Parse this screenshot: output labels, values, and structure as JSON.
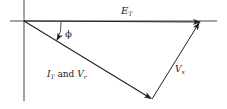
{
  "diagram": {
    "type": "phasor-diagram",
    "colors": {
      "line": "#222222",
      "background": "#ffffff"
    },
    "labels": {
      "et": {
        "main": "E",
        "sub": "T"
      },
      "phi": "ϕ",
      "it_vr": {
        "i_main": "I",
        "i_sub": "T",
        "and": " and ",
        "v_main": "V",
        "v_sub": "r"
      },
      "vx": {
        "main": "V",
        "sub": "x"
      }
    },
    "vectors": [
      {
        "name": "E_T",
        "from": [
          24,
          21
        ],
        "to": [
          200,
          22
        ]
      },
      {
        "name": "I_T and V_r",
        "from": [
          24,
          21
        ],
        "to": [
          152,
          99
        ]
      },
      {
        "name": "V_x",
        "from": [
          152,
          99
        ],
        "to": [
          200,
          22
        ]
      }
    ],
    "axes": {
      "horizontal": {
        "from": [
          10,
          21
        ],
        "to": [
          217,
          21
        ]
      },
      "vertical": {
        "from": [
          24,
          0
        ],
        "to": [
          24,
          101
        ]
      }
    },
    "angle": {
      "name": "phi",
      "between": [
        "E_T",
        "I_T and V_r"
      ]
    }
  }
}
